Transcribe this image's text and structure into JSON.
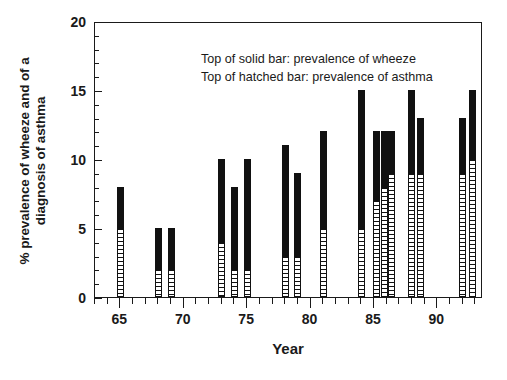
{
  "chart_data": {
    "type": "bar",
    "title": "",
    "xlabel": "Year",
    "ylabel": "% prevalence of wheeze and of a\ndiagnosis of asthma",
    "xlim": [
      63,
      93.6
    ],
    "ylim": [
      0,
      20
    ],
    "yticks_major": [
      0,
      5,
      10,
      15,
      20
    ],
    "ytick_labels": [
      "0",
      "5",
      "10",
      "15",
      "20"
    ],
    "xticks_major": [
      65,
      70,
      75,
      80,
      85,
      90
    ],
    "xtick_labels": [
      "65",
      "70",
      "75",
      "80",
      "85",
      "90"
    ],
    "ytick_minor_step": 1,
    "xtick_minor_step": 1,
    "grid": false,
    "legend_position": "inside-top-left",
    "annotations": [
      "Top of solid bar: prevalence of wheeze",
      "Top of hatched bar: prevalence of asthma"
    ],
    "series": [
      {
        "name": "prevalence of wheeze",
        "style": "solid-bar-top"
      },
      {
        "name": "prevalence of asthma",
        "style": "hatched-bar-top"
      }
    ],
    "categories": [
      65,
      68,
      69,
      73,
      74,
      75,
      78,
      79,
      81,
      84,
      85.2,
      85.8,
      86.4,
      88,
      88.7,
      92,
      92.8
    ],
    "wheeze": [
      8,
      5,
      5,
      10,
      8,
      10,
      11,
      9,
      12,
      15,
      12,
      12,
      12,
      15,
      13,
      13,
      15
    ],
    "asthma": [
      5,
      2,
      2,
      4,
      2,
      2,
      3,
      3,
      5,
      5,
      7,
      8,
      9,
      9,
      9,
      9,
      10
    ],
    "bars": [
      {
        "year": 65,
        "wheeze": 8,
        "asthma": 5
      },
      {
        "year": 68,
        "wheeze": 5,
        "asthma": 2
      },
      {
        "year": 69,
        "wheeze": 5,
        "asthma": 2
      },
      {
        "year": 73,
        "wheeze": 10,
        "asthma": 4
      },
      {
        "year": 74,
        "wheeze": 8,
        "asthma": 2
      },
      {
        "year": 75,
        "wheeze": 10,
        "asthma": 2
      },
      {
        "year": 78,
        "wheeze": 11,
        "asthma": 3
      },
      {
        "year": 79,
        "wheeze": 9,
        "asthma": 3
      },
      {
        "year": 81,
        "wheeze": 12,
        "asthma": 5
      },
      {
        "year": 84,
        "wheeze": 15,
        "asthma": 5
      },
      {
        "year": 85.2,
        "wheeze": 12,
        "asthma": 7
      },
      {
        "year": 85.8,
        "wheeze": 12,
        "asthma": 8
      },
      {
        "year": 86.4,
        "wheeze": 12,
        "asthma": 9
      },
      {
        "year": 88,
        "wheeze": 15,
        "asthma": 9
      },
      {
        "year": 88.7,
        "wheeze": 13,
        "asthma": 9
      },
      {
        "year": 92,
        "wheeze": 13,
        "asthma": 9
      },
      {
        "year": 92.8,
        "wheeze": 15,
        "asthma": 10
      }
    ]
  },
  "axes": {
    "x_title": "Year",
    "y_title": "% prevalence of wheeze and of a\ndiagnosis of asthma"
  },
  "legend": {
    "line1": "Top of solid bar: prevalence of wheeze",
    "line2": "Top of hatched bar: prevalence of asthma"
  },
  "colors": {
    "bar_solid": "#111111",
    "bar_hatch_fill": "#ffffff",
    "axis": "#1a1a1a",
    "background": "#ffffff"
  }
}
